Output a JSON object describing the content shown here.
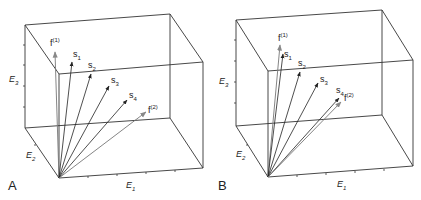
{
  "figure": {
    "panels": [
      {
        "id": "A",
        "label": "A",
        "axes": {
          "x": "E",
          "x_sub": "1",
          "y": "E",
          "y_sub": "2",
          "z": "E",
          "z_sub": "3"
        },
        "vectors": [
          {
            "name": "f",
            "sup": "(1)",
            "style": "gray"
          },
          {
            "name": "s",
            "sub": "1",
            "style": "black"
          },
          {
            "name": "s",
            "sub": "2",
            "style": "black"
          },
          {
            "name": "s",
            "sub": "3",
            "style": "black"
          },
          {
            "name": "s",
            "sub": "4",
            "style": "black"
          },
          {
            "name": "f",
            "sup": "(2)",
            "style": "gray"
          }
        ]
      },
      {
        "id": "B",
        "label": "B",
        "axes": {
          "x": "E",
          "x_sub": "1",
          "y": "E",
          "y_sub": "2",
          "z": "E",
          "z_sub": "3"
        },
        "vectors": [
          {
            "name": "f",
            "sup": "(1)",
            "style": "gray"
          },
          {
            "name": "s",
            "sub": "1",
            "style": "black"
          },
          {
            "name": "s",
            "sub": "2",
            "style": "black"
          },
          {
            "name": "s",
            "sub": "3",
            "style": "black"
          },
          {
            "name": "s",
            "sub": "4",
            "style": "black"
          },
          {
            "name": "f",
            "sup": "(2)",
            "style": "gray"
          }
        ]
      }
    ],
    "colors": {
      "line": "#333333",
      "vector": "#222222",
      "feature_vector": "#777777"
    }
  }
}
